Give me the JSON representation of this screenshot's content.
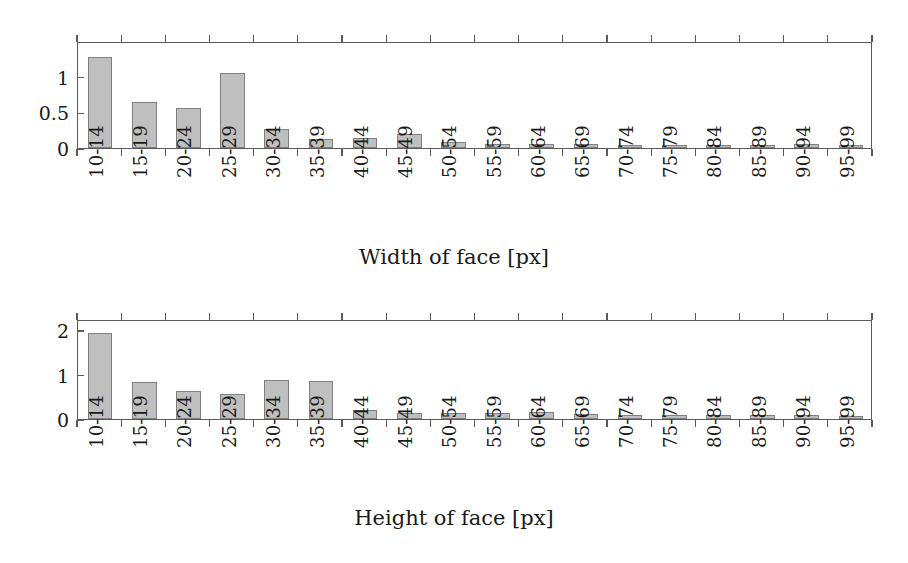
{
  "figure": {
    "background": "#ffffff",
    "bar_fill": "#bfbfbf",
    "bar_stroke": "#808080",
    "axis_color": "#5a5a5a",
    "text_color": "#1a1a1a"
  },
  "chart_data": [
    {
      "type": "bar",
      "id": "width-of-face",
      "title": "",
      "xlabel": "Width of face [px]",
      "ylabel": "",
      "grid": false,
      "legend": false,
      "categories": [
        "10-14",
        "15-19",
        "20-24",
        "25-29",
        "30-34",
        "35-39",
        "40-44",
        "45-49",
        "50-54",
        "55-59",
        "60-64",
        "65-69",
        "70-74",
        "75-79",
        "80-84",
        "85-89",
        "90-94",
        "95-99"
      ],
      "values": [
        1.28,
        0.65,
        0.56,
        1.05,
        0.26,
        0.13,
        0.14,
        0.2,
        0.08,
        0.05,
        0.06,
        0.06,
        0.04,
        0.04,
        0.04,
        0.04,
        0.06,
        0.02
      ],
      "ylim": [
        0,
        1.5
      ],
      "yticks": [
        0,
        0.5,
        1
      ],
      "ytick_labels": [
        "0",
        "0.5",
        "1"
      ],
      "xlim": [
        0,
        18
      ]
    },
    {
      "type": "bar",
      "id": "height-of-face",
      "title": "",
      "xlabel": "Height of face [px]",
      "ylabel": "",
      "grid": false,
      "legend": false,
      "categories": [
        "10-14",
        "15-19",
        "20-24",
        "25-29",
        "30-34",
        "35-39",
        "40-44",
        "45-49",
        "50-54",
        "55-59",
        "60-64",
        "65-69",
        "70-74",
        "75-79",
        "80-84",
        "85-89",
        "90-94",
        "95-99"
      ],
      "values": [
        1.93,
        0.84,
        0.64,
        0.56,
        0.88,
        0.86,
        0.2,
        0.13,
        0.14,
        0.13,
        0.16,
        0.11,
        0.08,
        0.09,
        0.08,
        0.09,
        0.08,
        0.06
      ],
      "ylim": [
        0,
        2.25
      ],
      "yticks": [
        0,
        1,
        2
      ],
      "ytick_labels": [
        "0",
        "1",
        "2"
      ],
      "xlim": [
        0,
        18
      ]
    }
  ]
}
